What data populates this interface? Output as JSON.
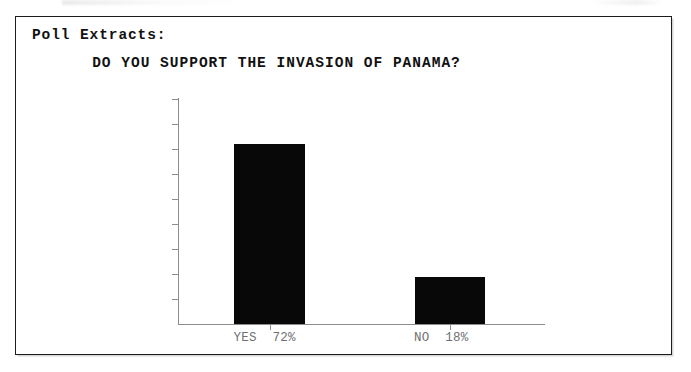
{
  "document": {
    "section_heading": "Poll Extracts:"
  },
  "chart_data": {
    "type": "bar",
    "title": "DO YOU SUPPORT THE INVASION OF PANAMA?",
    "xlabel": "",
    "ylabel": "",
    "categories": [
      "YES  72%",
      "NO  18%"
    ],
    "values": [
      72,
      19
    ],
    "ylim": [
      0,
      90
    ],
    "y_ticks": [
      90,
      80,
      70,
      60,
      50,
      40,
      30,
      20,
      10,
      0
    ],
    "grid": false,
    "legend": null,
    "bar_color": "#080808",
    "axis_color": "#8d8d90",
    "label_color": "#6f6f73"
  }
}
